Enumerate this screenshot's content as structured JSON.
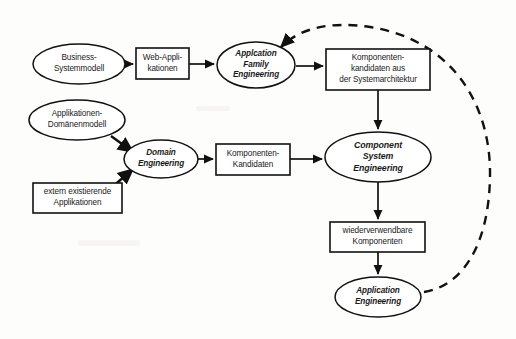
{
  "diagram": {
    "type": "flow-diagram",
    "language": "de",
    "background_color": "#fdfdfc",
    "stroke_color": "#111111",
    "text_color": "#1a1a1a",
    "nodes": [
      {
        "id": "business-systemmodell",
        "shape": "ellipse",
        "style": "artifact",
        "lines": [
          "Business-",
          "Systemmodell"
        ],
        "cx": 79,
        "cy": 64,
        "rx": 46,
        "ry": 20,
        "font_size": 8.2
      },
      {
        "id": "web-applikationen",
        "shape": "rect",
        "style": "artifact",
        "lines": [
          "Web-Appli-",
          "kationen"
        ],
        "x": 136,
        "y": 48,
        "w": 53,
        "h": 31,
        "font_size": 8.2
      },
      {
        "id": "application-family-engineering",
        "shape": "ellipse",
        "style": "process",
        "lines": [
          "Applcation",
          "Family",
          "Engineering"
        ],
        "cx": 256,
        "cy": 65,
        "rx": 39,
        "ry": 23,
        "font_size": 8.2
      },
      {
        "id": "komponentenkandidaten-systemarchitektur",
        "shape": "rect",
        "style": "artifact",
        "lines": [
          "Komponenten-",
          "kandidaten aus",
          "der Systemarchitektur"
        ],
        "x": 326,
        "y": 49,
        "w": 104,
        "h": 41,
        "font_size": 8.2
      },
      {
        "id": "applikationen-domaenenmodell",
        "shape": "ellipse",
        "style": "artifact",
        "lines": [
          "Applikationen-",
          "Domänenmodell"
        ],
        "cx": 77,
        "cy": 120,
        "rx": 48,
        "ry": 20,
        "font_size": 8.2
      },
      {
        "id": "domain-engineering",
        "shape": "ellipse",
        "style": "process",
        "lines": [
          "Domain",
          "Engineering"
        ],
        "cx": 161,
        "cy": 159,
        "rx": 37,
        "ry": 19,
        "font_size": 8.2
      },
      {
        "id": "komponenten-kandidaten",
        "shape": "rect",
        "style": "artifact",
        "lines": [
          "Komponenten-",
          "Kandidaten"
        ],
        "x": 216,
        "y": 144,
        "w": 74,
        "h": 31,
        "font_size": 8.2
      },
      {
        "id": "extern-existierende-applikationen",
        "shape": "rect",
        "style": "artifact",
        "lines": [
          "extern existierende",
          "Applikationen"
        ],
        "x": 33,
        "y": 183,
        "w": 89,
        "h": 30,
        "font_size": 8.2
      },
      {
        "id": "component-system-engineering",
        "shape": "ellipse",
        "style": "process",
        "lines": [
          "Component",
          "System",
          "Engineering"
        ],
        "cx": 378,
        "cy": 157,
        "rx": 53,
        "ry": 25,
        "font_size": 8.8
      },
      {
        "id": "wiederverwendbare-komponenten",
        "shape": "rect",
        "style": "artifact",
        "lines": [
          "wiederverwendbare",
          "Komponenten"
        ],
        "x": 330,
        "y": 222,
        "w": 95,
        "h": 30,
        "font_size": 8.2
      },
      {
        "id": "application-engineering",
        "shape": "ellipse",
        "style": "process",
        "lines": [
          "Application",
          "Engineering"
        ],
        "cx": 378,
        "cy": 297,
        "rx": 43,
        "ry": 20,
        "font_size": 8.2
      }
    ],
    "edges": [
      {
        "id": "edge-business-to-web",
        "from": "business-systemmodell",
        "to": "web-applikationen",
        "kind": "solid-arrow",
        "path": "M 126 64 L 133 64"
      },
      {
        "id": "edge-web-to-afe",
        "from": "web-applikationen",
        "to": "application-family-engineering",
        "kind": "solid-arrow",
        "path": "M 189 64 L 214 64"
      },
      {
        "id": "edge-afe-to-komponentenkandidaten",
        "from": "application-family-engineering",
        "to": "komponentenkandidaten-systemarchitektur",
        "kind": "solid-arrow",
        "path": "M 296 66 L 323 66"
      },
      {
        "id": "edge-komponentenkandidaten-to-cse",
        "from": "komponentenkandidaten-systemarchitektur",
        "to": "component-system-engineering",
        "kind": "solid-arrow",
        "path": "M 378 90 L 378 129"
      },
      {
        "id": "edge-domaenenmodell-to-domain",
        "from": "applikationen-domaenenmodell",
        "to": "domain-engineering",
        "kind": "solid-arrow-thick",
        "path": "M 111 136 L 133 152"
      },
      {
        "id": "edge-extern-to-domain",
        "from": "extern-existierende-applikationen",
        "to": "domain-engineering",
        "kind": "solid-arrow-thick",
        "path": "M 110 189 L 133 169"
      },
      {
        "id": "edge-domain-to-kandidaten",
        "from": "domain-engineering",
        "to": "komponenten-kandidaten",
        "kind": "solid-arrow",
        "path": "M 198 159 L 213 159"
      },
      {
        "id": "edge-kandidaten-to-cse",
        "from": "komponenten-kandidaten",
        "to": "component-system-engineering",
        "kind": "solid-arrow",
        "path": "M 290 159 L 322 159"
      },
      {
        "id": "edge-cse-to-wiederverwendbare",
        "from": "component-system-engineering",
        "to": "wiederverwendbare-komponenten",
        "kind": "solid-arrow",
        "path": "M 378 182 L 378 219"
      },
      {
        "id": "edge-wiederverwendbare-to-ae",
        "from": "wiederverwendbare-komponenten",
        "to": "application-engineering",
        "kind": "solid-arrow",
        "path": "M 378 252 L 378 274"
      },
      {
        "id": "edge-feedback-ae-to-afe",
        "from": "application-engineering",
        "to": "application-family-engineering",
        "kind": "dashed-arrow",
        "path": "M 424 292 C 462 286 489 246 490 176 C 491 104 452 40 370 27 C 330 21 300 28 281 47"
      }
    ]
  }
}
